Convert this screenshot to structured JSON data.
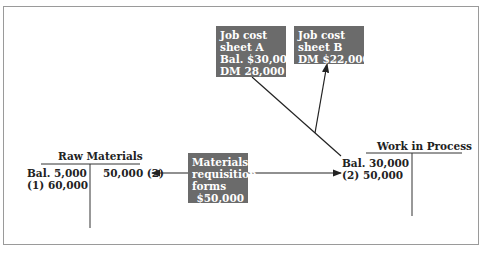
{
  "diagram": {
    "boxes": {
      "job_cost_a": {
        "lines": [
          "Job cost",
          "sheet A",
          "Bal. $30,000",
          "DM 28,000"
        ]
      },
      "job_cost_b": {
        "lines": [
          "Job cost",
          "sheet B",
          "DM $22,000"
        ]
      },
      "materials_requisition": {
        "lines": [
          "Materials",
          "requisition",
          "forms",
          "$50,000"
        ]
      }
    },
    "t_accounts": {
      "raw_materials": {
        "title": "Raw Materials",
        "debit": [
          "Bal. 5,000",
          "(1) 60,000"
        ],
        "credit": [
          "50,000 (2)"
        ]
      },
      "work_in_process": {
        "title": "Work in Process",
        "debit": [
          "Bal. 30,000",
          "(2) 50,000"
        ],
        "credit": []
      }
    },
    "colors": {
      "box_fill": "#6b6b6b",
      "box_text": "#ffffff",
      "line": "#222222",
      "frame": "#9a9a9a"
    }
  }
}
